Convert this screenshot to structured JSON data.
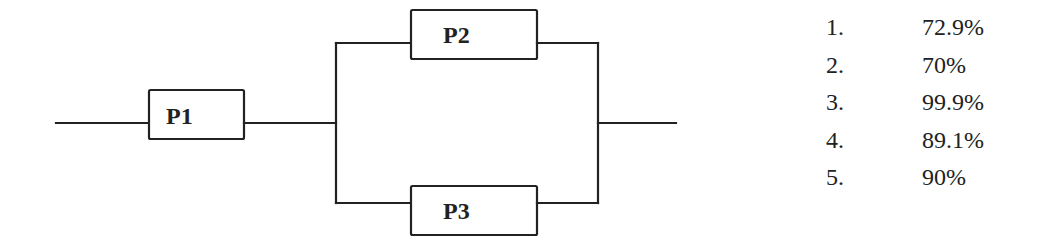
{
  "diagram": {
    "type": "reliability-block-diagram",
    "blocks": [
      {
        "id": "P1",
        "label": "P1",
        "position": "series"
      },
      {
        "id": "P2",
        "label": "P2",
        "position": "parallel-top"
      },
      {
        "id": "P3",
        "label": "P3",
        "position": "parallel-bottom"
      }
    ],
    "connections": [
      [
        "input",
        "P1"
      ],
      [
        "P1",
        "P2"
      ],
      [
        "P1",
        "P3"
      ],
      [
        "P2",
        "output"
      ],
      [
        "P3",
        "output"
      ]
    ],
    "stroke_color": "#222222"
  },
  "options": [
    {
      "number": "1.",
      "value": "72.9%"
    },
    {
      "number": "2.",
      "value": "70%"
    },
    {
      "number": "3.",
      "value": "99.9%"
    },
    {
      "number": "4.",
      "value": "89.1%"
    },
    {
      "number": "5.",
      "value": "90%"
    }
  ]
}
